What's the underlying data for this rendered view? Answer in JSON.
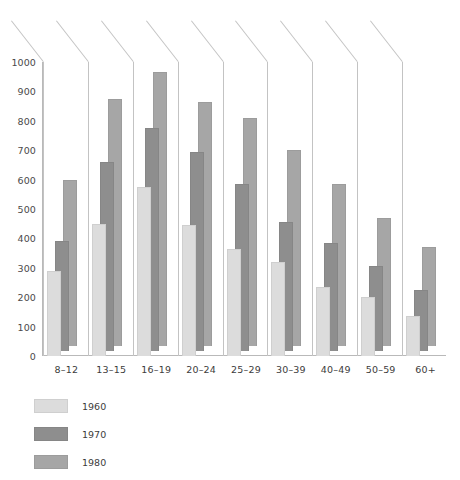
{
  "chart": {
    "title": "",
    "xlabel": "",
    "ylabel": ""
  },
  "legend": {
    "position": "below-left",
    "items": [
      {
        "name": "1960",
        "color": "#dcdcdc"
      },
      {
        "name": "1970",
        "color": "#8e8e8e"
      },
      {
        "name": "1980",
        "color": "#a6a6a6"
      }
    ]
  },
  "yaxis": {
    "ticks": [
      "0",
      "100",
      "200",
      "300",
      "400",
      "500",
      "600",
      "700",
      "800",
      "900",
      "1000"
    ]
  },
  "chart_data": {
    "type": "bar",
    "title": "",
    "xlabel": "",
    "ylabel": "",
    "ylim": [
      0,
      1000
    ],
    "ytick_step": 100,
    "grid": false,
    "legend_position": "below-left",
    "style": "3d-perspective-grouped-bars",
    "categories": [
      "8–12",
      "13–15",
      "16–19",
      "20–24",
      "25–29",
      "30–39",
      "40–49",
      "50–59",
      "60+"
    ],
    "series": [
      {
        "name": "1960",
        "color": "#dcdcdc",
        "values": [
          290,
          450,
          575,
          445,
          365,
          320,
          235,
          200,
          135
        ]
      },
      {
        "name": "1970",
        "color": "#8e8e8e",
        "values": [
          390,
          660,
          775,
          695,
          585,
          455,
          385,
          305,
          225
        ]
      },
      {
        "name": "1980",
        "color": "#a6a6a6",
        "values": [
          600,
          875,
          965,
          865,
          810,
          700,
          585,
          470,
          370
        ]
      }
    ]
  }
}
